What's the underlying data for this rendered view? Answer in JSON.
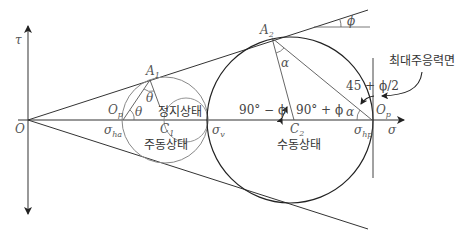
{
  "diagram": {
    "type": "Mohr circle diagram - earth pressure states (at-rest, active, passive)",
    "axes": {
      "x_label": "σ",
      "y_label": "τ",
      "origin_label": "O"
    },
    "points": {
      "A1": "A",
      "A1_sub": "1",
      "A2": "A",
      "A2_sub": "2",
      "C1": "C",
      "C1_sub": "1",
      "C2": "C",
      "C2_sub": "2",
      "Op_left": "O",
      "Op_left_sub": "p",
      "Op_right": "O",
      "Op_right_sub": "p"
    },
    "stress_labels": {
      "sigma_ha": "σ",
      "sigma_ha_sub": "ha",
      "sigma_v": "σ",
      "sigma_v_sub": "v",
      "sigma_hp": "σ",
      "sigma_hp_sub": "hp"
    },
    "angle_labels": {
      "theta_top": "θ",
      "theta_left": "θ",
      "alpha_top": "α",
      "alpha_right": "α",
      "phi": "ϕ",
      "ninety_minus_phi": "90° − ϕ",
      "ninety_plus_phi": "90° + ϕ",
      "fortyfive_plus_half_phi": "45 + ϕ/2"
    },
    "state_labels": {
      "at_rest": "정지상태",
      "active": "주동상태",
      "passive": "수동상태",
      "max_principal_plane": "최대주응력면"
    },
    "geometry": {
      "origin": [
        28,
        120
      ],
      "small_circle": {
        "cx": 165,
        "cy": 120,
        "r": 43
      },
      "inner_circle": {
        "cx": 186,
        "cy": 120,
        "r": 22
      },
      "large_circle": {
        "cx": 290,
        "cy": 120,
        "r": 83
      }
    },
    "colors": {
      "line": "#333333",
      "light_circle": "#888888",
      "text": "#333333"
    }
  }
}
